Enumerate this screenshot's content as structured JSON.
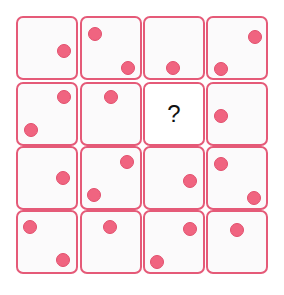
{
  "puzzle": {
    "rows": 4,
    "cols": 4,
    "accent_color": "#e55a78",
    "dot_color": "#f06480",
    "missing_label": "?",
    "cells": [
      {
        "row": 0,
        "col": 0,
        "dots": [
          {
            "x": 46,
            "y": 33
          }
        ]
      },
      {
        "row": 0,
        "col": 1,
        "dots": [
          {
            "x": 13,
            "y": 16
          },
          {
            "x": 46,
            "y": 50
          }
        ]
      },
      {
        "row": 0,
        "col": 2,
        "dots": [
          {
            "x": 28,
            "y": 50
          }
        ]
      },
      {
        "row": 0,
        "col": 3,
        "dots": [
          {
            "x": 13,
            "y": 51
          },
          {
            "x": 47,
            "y": 19
          }
        ]
      },
      {
        "row": 1,
        "col": 0,
        "dots": [
          {
            "x": 46,
            "y": 13
          },
          {
            "x": 13,
            "y": 46
          }
        ]
      },
      {
        "row": 1,
        "col": 1,
        "dots": [
          {
            "x": 29,
            "y": 13
          }
        ]
      },
      {
        "row": 1,
        "col": 2,
        "missing": true,
        "dots": []
      },
      {
        "row": 1,
        "col": 3,
        "dots": [
          {
            "x": 13,
            "y": 32
          }
        ]
      },
      {
        "row": 2,
        "col": 0,
        "dots": [
          {
            "x": 45,
            "y": 30
          }
        ]
      },
      {
        "row": 2,
        "col": 1,
        "dots": [
          {
            "x": 45,
            "y": 14
          },
          {
            "x": 12,
            "y": 47
          }
        ]
      },
      {
        "row": 2,
        "col": 2,
        "dots": [
          {
            "x": 45,
            "y": 33
          }
        ]
      },
      {
        "row": 2,
        "col": 3,
        "dots": [
          {
            "x": 13,
            "y": 16
          },
          {
            "x": 46,
            "y": 50
          }
        ]
      },
      {
        "row": 3,
        "col": 0,
        "dots": [
          {
            "x": 12,
            "y": 15
          },
          {
            "x": 45,
            "y": 48
          }
        ]
      },
      {
        "row": 3,
        "col": 1,
        "dots": [
          {
            "x": 28,
            "y": 15
          }
        ]
      },
      {
        "row": 3,
        "col": 2,
        "dots": [
          {
            "x": 45,
            "y": 17
          },
          {
            "x": 12,
            "y": 50
          }
        ]
      },
      {
        "row": 3,
        "col": 3,
        "dots": [
          {
            "x": 29,
            "y": 18
          }
        ]
      }
    ]
  }
}
